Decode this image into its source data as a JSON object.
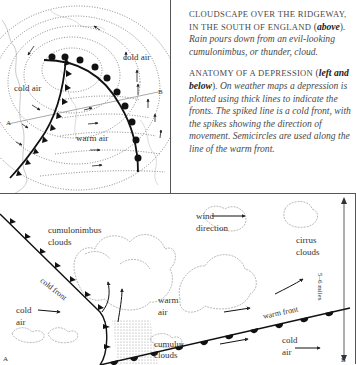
{
  "caption": {
    "p1_caps": "CLOUDSCAPE OVER THE RIDGEWAY, IN THE SOUTH OF ENGLAND",
    "p1_ref": "above",
    "p1_text": ". Rain pours down from an evil-looking cumulonimbus, or thunder, cloud.",
    "p2_caps": "ANATOMY OF A DEPRESSION",
    "p2_ref": "left and below",
    "p2_text": ". On weather maps a depression is plotted using thick lines to indicate the fronts. The spiked line is a cold front, with the spikes showing the direction of movement. Semicircles are used along the line of the warm front."
  },
  "map": {
    "labels": {
      "cold_air_top": "cold air",
      "cold_air_left": "cold air",
      "warm_air": "warm air",
      "point_a": "A",
      "point_b": "B"
    }
  },
  "section": {
    "labels": {
      "cumulonimbus": "cumulonimbus clouds",
      "cold_front": "cold front",
      "cold_air_left": "cold air",
      "warm_air": "warm air",
      "cumulus": "cumulus clouds",
      "wind_direction": "wind direction",
      "cirrus": "cirrus clouds",
      "warm_front": "warm front",
      "cold_air_right": "cold air",
      "height": "5–6 miles",
      "point_a": "A",
      "point_b": "B"
    }
  }
}
